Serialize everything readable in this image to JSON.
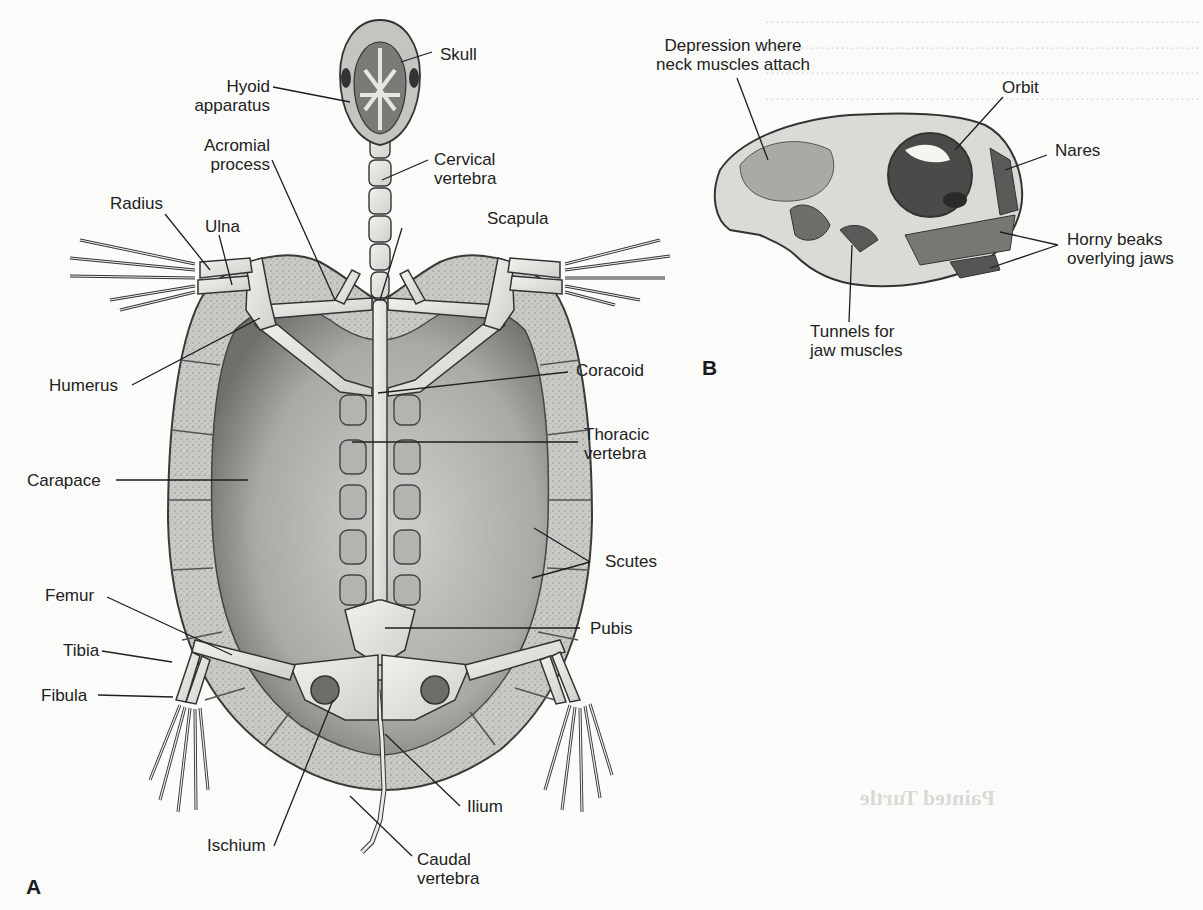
{
  "figure": {
    "panel_a": {
      "letter": "A",
      "view": "Turtle skeleton, dorsal view with carapace",
      "labels": {
        "skull": "Skull",
        "hyoid_1": "Hyoid",
        "hyoid_2": "apparatus",
        "acromial_1": "Acromial",
        "acromial_2": "process",
        "cervical_1": "Cervical",
        "cervical_2": "vertebra",
        "radius": "Radius",
        "ulna": "Ulna",
        "scapula": "Scapula",
        "humerus": "Humerus",
        "coracoid": "Coracoid",
        "thoracic_1": "Thoracic",
        "thoracic_2": "vertebra",
        "carapace": "Carapace",
        "scutes": "Scutes",
        "femur": "Femur",
        "pubis": "Pubis",
        "tibia": "Tibia",
        "fibula": "Fibula",
        "ilium": "Ilium",
        "ischium": "Ischium",
        "caudal_1": "Caudal",
        "caudal_2": "vertebra"
      }
    },
    "panel_b": {
      "letter": "B",
      "view": "Turtle skull, lateral view",
      "labels": {
        "depression_1": "Depression where",
        "depression_2": "neck muscles attach",
        "orbit": "Orbit",
        "nares": "Nares",
        "beaks_1": "Horny beaks",
        "beaks_2": "overlying jaws",
        "tunnels_1": "Tunnels for",
        "tunnels_2": "jaw muscles"
      }
    }
  },
  "background_bleedthrough": {
    "heading_1": "Skeletal Structure",
    "heading_2": "Painted Turtle"
  }
}
